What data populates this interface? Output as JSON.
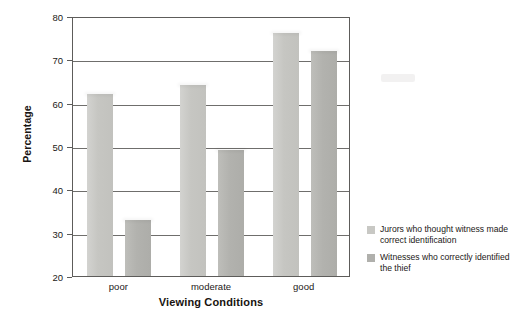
{
  "chart_data": {
    "type": "bar",
    "title": "",
    "xlabel": "Viewing Conditions",
    "ylabel": "Percentage",
    "categories": [
      "poor",
      "moderate",
      "good"
    ],
    "series": [
      {
        "name": "Jurors who thought witness made correct identification",
        "color": "#c8c8c4",
        "values": [
          62,
          64,
          76
        ]
      },
      {
        "name": "Witnesses who correctly identified the thief",
        "color": "#b0b0ac",
        "values": [
          33,
          49,
          72
        ]
      }
    ],
    "ylim": [
      20,
      80
    ],
    "yticks": [
      20,
      30,
      40,
      50,
      60,
      70,
      80
    ],
    "ytick_labels": [
      "20",
      "30",
      "40",
      "50",
      "60",
      "70",
      "80"
    ],
    "grid": true,
    "legend_position": "right"
  },
  "legend": {
    "items": [
      {
        "label": "Jurors who thought witness made correct identification"
      },
      {
        "label": "Witnesses who correctly identified the thief"
      }
    ]
  }
}
